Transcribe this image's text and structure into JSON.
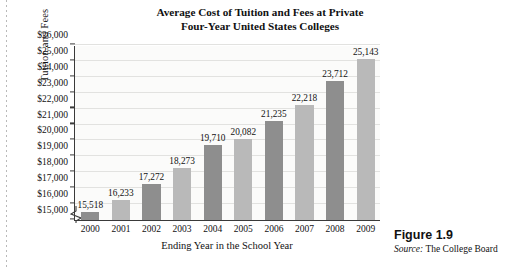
{
  "figure": {
    "number": "Figure 1.9",
    "source_lead": "Source:",
    "source_text": " The College Board"
  },
  "chart_data": {
    "type": "bar",
    "title": "Average Cost of Tuition and Fees at Private Four-Year United States Colleges",
    "title_line1": "Average Cost of Tuition and Fees at Private",
    "title_line2": "Four-Year United States Colleges",
    "xlabel": "Ending Year in the School Year",
    "ylabel": "Tuition and Fees",
    "categories": [
      "2000",
      "2001",
      "2002",
      "2003",
      "2004",
      "2005",
      "2006",
      "2007",
      "2008",
      "2009"
    ],
    "values": [
      15518,
      16233,
      17272,
      18273,
      19710,
      20082,
      21235,
      22218,
      23712,
      25143
    ],
    "value_labels": [
      "15,518",
      "16,233",
      "17,272",
      "18,273",
      "19,710",
      "20,082",
      "21,235",
      "22,218",
      "23,712",
      "25,143"
    ],
    "bar_shades": [
      "dark",
      "light",
      "dark",
      "light",
      "dark",
      "light",
      "dark",
      "light",
      "dark",
      "light"
    ],
    "ylim": [
      15000,
      26000
    ],
    "ytick_values": [
      15000,
      16000,
      17000,
      18000,
      19000,
      20000,
      21000,
      22000,
      23000,
      24000,
      25000,
      26000
    ],
    "ytick_labels": [
      "$15,000",
      "$16,000",
      "$17,000",
      "$18,000",
      "$19,000",
      "$20,000",
      "$21,000",
      "$22,000",
      "$23,000",
      "$24,000",
      "$25,000",
      "$26,000"
    ],
    "grid": true,
    "legend": false,
    "axis_break": true,
    "colors": {
      "bar_dark": "#8e8e8e",
      "bar_light": "#b9b9b9",
      "gridline": "#e2e2e0",
      "axis": "#3a3a3a",
      "plot_background": "#fbfbfa",
      "text": "#111111"
    }
  }
}
